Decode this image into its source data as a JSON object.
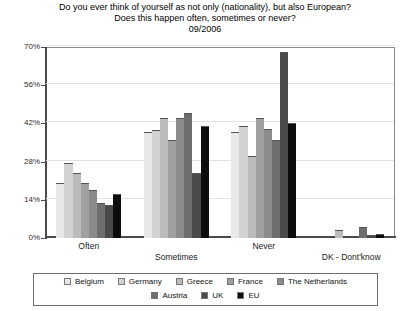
{
  "title": {
    "line1": "Do you ever think of yourself as not only (nationality), but also European?",
    "line2": "Does this happen often, sometimes or never?",
    "line3": "09/2006"
  },
  "chart_data": {
    "type": "bar",
    "title": "Do you ever think of yourself as not only (nationality), but also European? Does this happen often, sometimes or never? 09/2006",
    "subtitle": "09/2006",
    "xlabel": "",
    "ylabel": "",
    "categories": [
      "Often",
      "Sometimes",
      "Never",
      "DK - Dont'know"
    ],
    "ylim": [
      0,
      70
    ],
    "yticks": [
      0,
      14,
      28,
      42,
      56,
      70
    ],
    "ytick_labels": [
      "0%",
      "14%",
      "28%",
      "42%",
      "56%",
      "70%"
    ],
    "grid": true,
    "legend_position": "bottom",
    "series": [
      {
        "name": "Belgium",
        "color": "#e8e8e8",
        "values": [
          20.0,
          39.0,
          39.0,
          0.0
        ]
      },
      {
        "name": "Germany",
        "color": "#d2d2d2",
        "values": [
          27.5,
          39.5,
          41.0,
          0.0
        ]
      },
      {
        "name": "Greece",
        "color": "#bcbcbc",
        "values": [
          24.0,
          44.0,
          30.0,
          3.0
        ]
      },
      {
        "name": "France",
        "color": "#a0a0a0",
        "values": [
          20.0,
          36.0,
          44.0,
          0.0
        ]
      },
      {
        "name": "The Netherlands",
        "color": "#8c8c8c",
        "values": [
          17.5,
          44.0,
          40.0,
          0.0
        ]
      },
      {
        "name": "Austria",
        "color": "#6e6e6e",
        "values": [
          13.0,
          46.0,
          36.0,
          4.0
        ]
      },
      {
        "name": "UK",
        "color": "#4a4a4a",
        "values": [
          12.0,
          24.0,
          68.0,
          1.0
        ]
      },
      {
        "name": "EU",
        "color": "#0d0d0d",
        "values": [
          16.0,
          41.0,
          42.0,
          1.5
        ]
      }
    ]
  },
  "legend": {
    "row1": [
      "Belgium",
      "Germany",
      "Greece",
      "France",
      "The Netherlands"
    ],
    "row2": [
      "Austria",
      "UK",
      "EU"
    ]
  }
}
